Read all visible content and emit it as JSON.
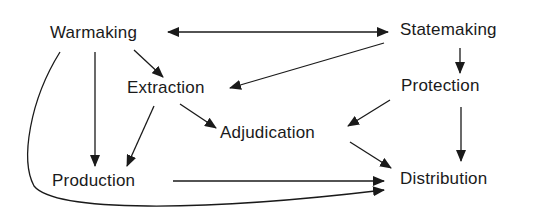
{
  "diagram": {
    "type": "flow-diagram",
    "nodes": {
      "warmaking": {
        "label": "Warmaking"
      },
      "statemaking": {
        "label": "Statemaking"
      },
      "extraction": {
        "label": "Extraction"
      },
      "protection": {
        "label": "Protection"
      },
      "adjudication": {
        "label": "Adjudication"
      },
      "production": {
        "label": "Production"
      },
      "distribution": {
        "label": "Distribution"
      }
    },
    "edges": [
      {
        "from": "Warmaking",
        "to": "Statemaking",
        "bidirectional": true
      },
      {
        "from": "Statemaking",
        "to": "Extraction"
      },
      {
        "from": "Statemaking",
        "to": "Protection"
      },
      {
        "from": "Warmaking",
        "to": "Extraction"
      },
      {
        "from": "Warmaking",
        "to": "Production"
      },
      {
        "from": "Warmaking",
        "to": "Distribution",
        "curved": true
      },
      {
        "from": "Extraction",
        "to": "Production"
      },
      {
        "from": "Extraction",
        "to": "Adjudication"
      },
      {
        "from": "Protection",
        "to": "Adjudication"
      },
      {
        "from": "Protection",
        "to": "Distribution"
      },
      {
        "from": "Adjudication",
        "to": "Distribution"
      },
      {
        "from": "Production",
        "to": "Distribution"
      }
    ],
    "colors": {
      "line": "#1a1a1a",
      "text": "#1a1a1a",
      "background": "#ffffff"
    }
  }
}
